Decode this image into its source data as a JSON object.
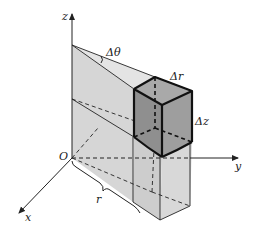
{
  "figure": {
    "labels": {
      "z_axis": "z",
      "y_axis": "y",
      "x_axis": "x",
      "origin": "O",
      "radius": "r",
      "delta_theta": "Δθ",
      "delta_r": "Δr",
      "delta_z": "Δz"
    },
    "colors": {
      "wedge_fill": "#d9d9d9",
      "slab_fill": "#cfcfcf",
      "element_fill": "#9a9a9a",
      "element_top": "#a8a8a8",
      "line": "#222222",
      "background": "#ffffff"
    }
  }
}
